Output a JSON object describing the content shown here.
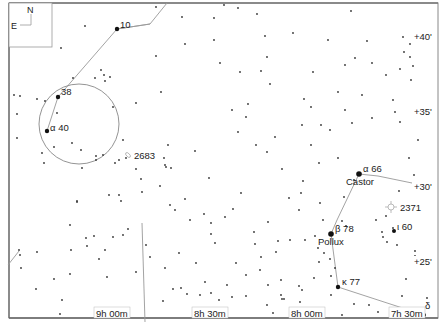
{
  "map": {
    "type": "star-chart",
    "compass": {
      "north": "N",
      "east": "E"
    },
    "dec_labels": [
      {
        "label": "+40'",
        "x": 414,
        "y": 40
      },
      {
        "label": "+35'",
        "x": 414,
        "y": 115
      },
      {
        "label": "+30'",
        "x": 414,
        "y": 190
      },
      {
        "label": "+25'",
        "x": 414,
        "y": 265
      }
    ],
    "ra_labels": [
      {
        "label": "9h 00m",
        "x": 96,
        "y": 317
      },
      {
        "label": "8h 30m",
        "x": 194,
        "y": 317
      },
      {
        "label": "8h 00m",
        "x": 291,
        "y": 317
      },
      {
        "label": "7h 30m",
        "x": 391,
        "y": 317
      }
    ],
    "named_stars": [
      {
        "label": "10",
        "x": 117,
        "y": 29,
        "lx": 120,
        "ly": 28,
        "size": 2.2
      },
      {
        "label": "38",
        "x": 58,
        "y": 97,
        "lx": 61,
        "ly": 95,
        "size": 2.2
      },
      {
        "label": "α  40",
        "x": 47,
        "y": 131,
        "lx": 50,
        "ly": 131,
        "size": 2.2
      },
      {
        "label": "α  66",
        "x": 359,
        "y": 174,
        "lx": 363,
        "ly": 172,
        "size": 2.8
      },
      {
        "label": "Castor",
        "x": 0,
        "y": 0,
        "lx": 346,
        "ly": 185,
        "size": 0
      },
      {
        "label": "β  78",
        "x": 331,
        "y": 234,
        "lx": 335,
        "ly": 232,
        "size": 2.8
      },
      {
        "label": "Pollux",
        "x": 0,
        "y": 0,
        "lx": 318,
        "ly": 245,
        "size": 0
      },
      {
        "label": "ι 60",
        "x": 394,
        "y": 231,
        "lx": 397,
        "ly": 230,
        "size": 2
      },
      {
        "label": "κ  77",
        "x": 338,
        "y": 287,
        "lx": 342,
        "ly": 285,
        "size": 2.2
      },
      {
        "label": "δ",
        "x": 424,
        "y": 315,
        "lx": 425,
        "ly": 309,
        "size": 2
      }
    ],
    "deep_sky": [
      {
        "label": "2683",
        "type": "galaxy",
        "x": 128,
        "y": 155,
        "lx": 134,
        "ly": 159
      },
      {
        "label": "2371",
        "type": "planetary-nebula",
        "x": 391,
        "y": 207,
        "lx": 400,
        "ly": 211
      }
    ],
    "field_circle": {
      "cx": 79,
      "cy": 124,
      "r": 40
    },
    "constellation_lines": [
      [
        [
          47,
          131
        ],
        [
          58,
          97
        ],
        [
          117,
          29
        ],
        [
          150,
          24
        ],
        [
          167,
          3
        ]
      ],
      [
        [
          117,
          29
        ],
        [
          150,
          24
        ]
      ],
      [
        [
          359,
          174
        ],
        [
          378,
          176
        ],
        [
          412,
          183
        ]
      ],
      [
        [
          359,
          174
        ],
        [
          337,
          220
        ],
        [
          331,
          234
        ],
        [
          338,
          287
        ],
        [
          424,
          315
        ]
      ],
      [
        [
          142,
          223
        ],
        [
          145,
          322
        ]
      ],
      [
        [
          19,
          251
        ],
        [
          8,
          265
        ]
      ]
    ]
  },
  "chart_data": {
    "type": "scatter",
    "title": "",
    "xlabel": "Right Ascension",
    "ylabel": "Declination",
    "x_ticks": [
      "9h 00m",
      "8h 30m",
      "8h 00m",
      "7h 30m"
    ],
    "y_ticks": [
      "+25'",
      "+30'",
      "+35'",
      "+40'"
    ],
    "objects": [
      {
        "name": "10",
        "type": "star"
      },
      {
        "name": "38",
        "type": "star"
      },
      {
        "name": "α 40",
        "type": "star"
      },
      {
        "name": "α 66 (Castor)",
        "type": "star"
      },
      {
        "name": "β 78 (Pollux)",
        "type": "star"
      },
      {
        "name": "ι 60",
        "type": "star"
      },
      {
        "name": "κ 77",
        "type": "star"
      },
      {
        "name": "δ",
        "type": "star"
      },
      {
        "name": "2683",
        "type": "galaxy"
      },
      {
        "name": "2371",
        "type": "planetary-nebula"
      }
    ]
  },
  "stars": [
    [
      85,
      26
    ],
    [
      61,
      48
    ],
    [
      73,
      78
    ],
    [
      95,
      78
    ],
    [
      101,
      70
    ],
    [
      104,
      75
    ],
    [
      110,
      77
    ],
    [
      105,
      81
    ],
    [
      14,
      95
    ],
    [
      20,
      96
    ],
    [
      37,
      99
    ],
    [
      45,
      101
    ],
    [
      17,
      114
    ],
    [
      57,
      113
    ],
    [
      113,
      107
    ],
    [
      136,
      103
    ],
    [
      17,
      138
    ],
    [
      54,
      147
    ],
    [
      72,
      143
    ],
    [
      81,
      150
    ],
    [
      96,
      156
    ],
    [
      96,
      160
    ],
    [
      103,
      155
    ],
    [
      115,
      163
    ],
    [
      119,
      160
    ],
    [
      126,
      158
    ],
    [
      42,
      153
    ],
    [
      44,
      163
    ],
    [
      82,
      168
    ],
    [
      136,
      169
    ],
    [
      156,
      56
    ],
    [
      161,
      92
    ],
    [
      123,
      140
    ],
    [
      168,
      145
    ],
    [
      164,
      158
    ],
    [
      165,
      165
    ],
    [
      166,
      167
    ],
    [
      171,
      168
    ],
    [
      195,
      151
    ],
    [
      209,
      178
    ],
    [
      232,
      110
    ],
    [
      238,
      132
    ],
    [
      182,
      17
    ],
    [
      214,
      18
    ],
    [
      257,
      14
    ],
    [
      270,
      84
    ],
    [
      293,
      33
    ],
    [
      304,
      99
    ],
    [
      311,
      107
    ],
    [
      246,
      117
    ],
    [
      248,
      104
    ],
    [
      265,
      36
    ],
    [
      328,
      40
    ],
    [
      351,
      11
    ],
    [
      367,
      41
    ],
    [
      403,
      37
    ],
    [
      345,
      65
    ],
    [
      355,
      58
    ],
    [
      372,
      63
    ],
    [
      393,
      100
    ],
    [
      395,
      112
    ],
    [
      386,
      75
    ],
    [
      400,
      69
    ],
    [
      413,
      66
    ],
    [
      404,
      52
    ],
    [
      410,
      57
    ],
    [
      410,
      44
    ],
    [
      411,
      80
    ],
    [
      400,
      122
    ],
    [
      409,
      158
    ],
    [
      414,
      175
    ],
    [
      399,
      191
    ],
    [
      386,
      216
    ],
    [
      376,
      220
    ],
    [
      393,
      228
    ],
    [
      382,
      232
    ],
    [
      383,
      237
    ],
    [
      397,
      245
    ],
    [
      387,
      242
    ],
    [
      415,
      251
    ],
    [
      418,
      140
    ],
    [
      303,
      181
    ],
    [
      338,
      158
    ],
    [
      344,
      197
    ],
    [
      346,
      226
    ],
    [
      354,
      180
    ],
    [
      305,
      240
    ],
    [
      315,
      236
    ],
    [
      318,
      248
    ],
    [
      323,
      220
    ],
    [
      342,
      221
    ],
    [
      299,
      210
    ],
    [
      320,
      203
    ],
    [
      331,
      276
    ],
    [
      324,
      253
    ],
    [
      330,
      259
    ],
    [
      335,
      268
    ],
    [
      319,
      262
    ],
    [
      314,
      278
    ],
    [
      354,
      304
    ],
    [
      342,
      315
    ],
    [
      369,
      305
    ],
    [
      378,
      312
    ],
    [
      402,
      296
    ],
    [
      406,
      279
    ],
    [
      427,
      298
    ],
    [
      415,
      256
    ],
    [
      331,
      295
    ],
    [
      284,
      299
    ],
    [
      300,
      302
    ],
    [
      310,
      314
    ],
    [
      299,
      286
    ],
    [
      302,
      290
    ],
    [
      267,
      305
    ],
    [
      273,
      313
    ],
    [
      281,
      295
    ],
    [
      282,
      299
    ],
    [
      246,
      296
    ],
    [
      232,
      297
    ],
    [
      219,
      300
    ],
    [
      211,
      293
    ],
    [
      200,
      295
    ],
    [
      187,
      294
    ],
    [
      181,
      288
    ],
    [
      173,
      289
    ],
    [
      163,
      301
    ],
    [
      136,
      272
    ],
    [
      150,
      257
    ],
    [
      107,
      277
    ],
    [
      70,
      274
    ],
    [
      36,
      289
    ],
    [
      54,
      279
    ],
    [
      60,
      314
    ],
    [
      62,
      300
    ],
    [
      19,
      250
    ],
    [
      20,
      255
    ],
    [
      21,
      268
    ],
    [
      37,
      252
    ],
    [
      71,
      250
    ],
    [
      99,
      259
    ],
    [
      105,
      250
    ],
    [
      86,
      238
    ],
    [
      87,
      246
    ],
    [
      94,
      236
    ],
    [
      70,
      225
    ],
    [
      77,
      201
    ],
    [
      77,
      202
    ],
    [
      121,
      201
    ],
    [
      128,
      229
    ],
    [
      123,
      235
    ],
    [
      113,
      237
    ],
    [
      109,
      195
    ],
    [
      119,
      195
    ],
    [
      141,
      179
    ],
    [
      142,
      192
    ],
    [
      146,
      245
    ],
    [
      211,
      234
    ],
    [
      215,
      243
    ],
    [
      236,
      263
    ],
    [
      241,
      193
    ],
    [
      211,
      223
    ],
    [
      225,
      217
    ],
    [
      233,
      209
    ],
    [
      204,
      214
    ],
    [
      278,
      241
    ],
    [
      254,
      232
    ],
    [
      268,
      222
    ],
    [
      255,
      244
    ],
    [
      261,
      257
    ],
    [
      276,
      252
    ],
    [
      290,
      240
    ],
    [
      260,
      270
    ],
    [
      246,
      275
    ],
    [
      227,
      285
    ],
    [
      268,
      285
    ],
    [
      281,
      280
    ],
    [
      179,
      253
    ],
    [
      205,
      282
    ],
    [
      165,
      268
    ],
    [
      196,
      263
    ],
    [
      190,
      220
    ],
    [
      170,
      205
    ],
    [
      175,
      210
    ],
    [
      160,
      186
    ],
    [
      185,
      199
    ],
    [
      289,
      198
    ],
    [
      301,
      193
    ],
    [
      282,
      169
    ],
    [
      267,
      152
    ],
    [
      256,
      145
    ],
    [
      275,
      137
    ],
    [
      302,
      125
    ],
    [
      319,
      163
    ],
    [
      321,
      125
    ],
    [
      311,
      145
    ],
    [
      330,
      130
    ],
    [
      240,
      72
    ],
    [
      220,
      63
    ],
    [
      214,
      40
    ],
    [
      185,
      44
    ],
    [
      156,
      7
    ],
    [
      238,
      8
    ],
    [
      224,
      5
    ],
    [
      362,
      95
    ],
    [
      372,
      118
    ],
    [
      352,
      123
    ],
    [
      338,
      92
    ],
    [
      345,
      110
    ],
    [
      313,
      72
    ],
    [
      261,
      71
    ],
    [
      267,
      57
    ]
  ]
}
